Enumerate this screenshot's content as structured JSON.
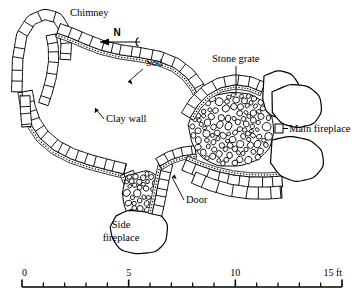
{
  "figure": {
    "type": "archaeological-site-plan"
  },
  "labels": {
    "chimney": "Chimney",
    "sod": "Sod",
    "clay_wall": "Clay wall",
    "stone_grate": "Stone grate",
    "main_fireplace": "Main fireplace",
    "door": "Door",
    "side_fireplace_line1": "Side",
    "side_fireplace_line2": "fireplace"
  },
  "compass": {
    "letter": "N",
    "direction": "left"
  },
  "scale_bar": {
    "unit": "ft",
    "min": 0,
    "max": 15,
    "tick_interval": 1,
    "major_interval": 5,
    "tick_labels": [
      "0",
      "5",
      "10",
      "15 ft"
    ],
    "label_values": [
      0,
      5,
      10,
      15
    ]
  },
  "colors": {
    "ink": "#000000",
    "paper": "#ffffff"
  }
}
